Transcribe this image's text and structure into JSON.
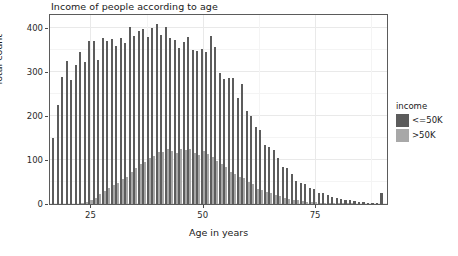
{
  "chart_data": {
    "type": "bar",
    "title": "Income of people according to age",
    "xlabel": "Age in years",
    "ylabel": "Total count",
    "xlim": [
      16,
      91
    ],
    "ylim": [
      0,
      430
    ],
    "xticks": [
      "25",
      "50",
      "75"
    ],
    "xtick_values": [
      25,
      50,
      75
    ],
    "yticks": [
      "0",
      "100",
      "200",
      "300",
      "400"
    ],
    "ytick_values": [
      0,
      100,
      200,
      300,
      400
    ],
    "grid": true,
    "legend_position": "right",
    "legend_title": "income",
    "bar_mode": "dodge",
    "x": [
      17,
      18,
      19,
      20,
      21,
      22,
      23,
      24,
      25,
      26,
      27,
      28,
      29,
      30,
      31,
      32,
      33,
      34,
      35,
      36,
      37,
      38,
      39,
      40,
      41,
      42,
      43,
      44,
      45,
      46,
      47,
      48,
      49,
      50,
      51,
      52,
      53,
      54,
      55,
      56,
      57,
      58,
      59,
      60,
      61,
      62,
      63,
      64,
      65,
      66,
      67,
      68,
      69,
      70,
      71,
      72,
      73,
      74,
      75,
      76,
      77,
      78,
      79,
      80,
      81,
      82,
      83,
      84,
      85,
      86,
      87,
      88,
      89,
      90
    ],
    "series": [
      {
        "name": "<=50K",
        "color": "#5c5c5c",
        "values": [
          150,
          225,
          290,
          325,
          283,
          316,
          346,
          322,
          370,
          370,
          327,
          378,
          370,
          376,
          360,
          377,
          366,
          403,
          383,
          394,
          398,
          380,
          400,
          409,
          385,
          402,
          377,
          374,
          355,
          368,
          381,
          350,
          348,
          352,
          345,
          382,
          357,
          298,
          285,
          286,
          286,
          242,
          272,
          212,
          200,
          176,
          169,
          134,
          129,
          123,
          104,
          85,
          82,
          69,
          52,
          48,
          46,
          37,
          34,
          26,
          24,
          20,
          16,
          14,
          11,
          9,
          8,
          6,
          5,
          4,
          3,
          3,
          2,
          26
        ]
      },
      {
        "name": ">50K",
        "color": "#a8a8a8",
        "values": [
          0,
          0,
          0,
          0,
          0,
          0,
          2,
          4,
          9,
          14,
          22,
          30,
          37,
          44,
          48,
          57,
          61,
          72,
          83,
          90,
          95,
          104,
          110,
          119,
          118,
          126,
          121,
          117,
          125,
          122,
          126,
          116,
          112,
          121,
          113,
          107,
          98,
          90,
          84,
          72,
          68,
          62,
          59,
          51,
          45,
          35,
          33,
          28,
          24,
          20,
          18,
          14,
          12,
          10,
          8,
          7,
          5,
          4,
          4,
          3,
          2,
          2,
          2,
          1,
          1,
          1,
          1,
          0,
          0,
          0,
          0,
          0,
          0,
          0
        ]
      }
    ]
  },
  "legend": {
    "title": "income",
    "items": [
      {
        "label": "<=50K",
        "color": "#5c5c5c"
      },
      {
        "label": ">50K",
        "color": "#a8a8a8"
      }
    ]
  },
  "colors": {
    "panel_border": "#5b5b5b",
    "gridline_major": "#e9e9e9",
    "gridline_minor": "#f4f4f4",
    "text": "#1a1a1a",
    "background": "#ffffff"
  }
}
